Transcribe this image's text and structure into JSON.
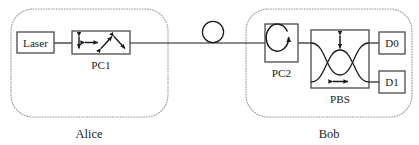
{
  "diagram": {
    "stroke_color": "#1b1b1b",
    "enclosure_color": "#8a8a8a",
    "background": "#ffffff"
  },
  "alice": {
    "zone_label": "Alice",
    "laser": {
      "label": "Laser",
      "name": "laser-source"
    },
    "pc1": {
      "label": "PC1",
      "name": "polarization-controller-1",
      "states": [
        {
          "name": "vertical-polarization-arrow",
          "glyph": "updown"
        },
        {
          "name": "horizontal-polarization-arrow",
          "glyph": "leftright"
        },
        {
          "name": "diagonal-polarization-arrow",
          "glyph": "diagonal-up"
        },
        {
          "name": "antidiagonal-polarization-arrow",
          "glyph": "diagonal-down"
        }
      ]
    }
  },
  "channel": {
    "name": "optical-fiber-channel",
    "spool_label": "",
    "spool_name": "fiber-spool-coil"
  },
  "bob": {
    "zone_label": "Bob",
    "pc2": {
      "label": "PC2",
      "name": "polarization-controller-2"
    },
    "pbs": {
      "label": "PBS",
      "name": "polarizing-beam-splitter",
      "ports": [
        {
          "name": "pbs-vertical-arrow",
          "glyph": "updown"
        },
        {
          "name": "pbs-horizontal-arrow",
          "glyph": "leftright"
        }
      ]
    },
    "detectors": [
      {
        "label": "D0",
        "name": "detector-d0"
      },
      {
        "label": "D1",
        "name": "detector-d1"
      }
    ]
  }
}
